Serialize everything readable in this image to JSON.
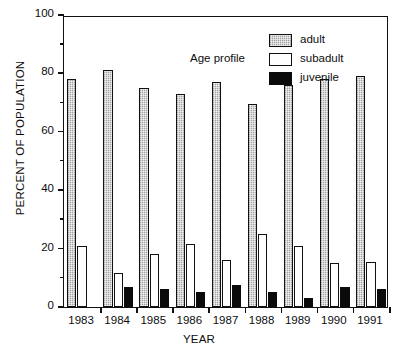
{
  "chart_data": {
    "type": "bar",
    "title": "",
    "subtitle": "",
    "xlabel": "YEAR",
    "ylabel": "PERCENT OF POPULATION",
    "categories": [
      "1983",
      "1984",
      "1985",
      "1986",
      "1987",
      "1988",
      "1989",
      "1990",
      "1991"
    ],
    "series": [
      {
        "name": "adult",
        "values": [
          78,
          81,
          75,
          73,
          77,
          69.5,
          76,
          78,
          79
        ]
      },
      {
        "name": "subadult",
        "values": [
          21,
          11.5,
          18,
          21.5,
          16,
          25,
          21,
          15,
          15.5
        ]
      },
      {
        "name": "juvenile",
        "values": [
          0,
          7,
          6,
          5,
          7.5,
          5,
          3,
          7,
          6
        ]
      }
    ],
    "ylim": [
      0,
      100
    ],
    "yticks": [
      0,
      20,
      40,
      60,
      80,
      100
    ],
    "ytick_labels": [
      "0",
      "20",
      "40",
      "60",
      "80",
      "100"
    ],
    "yminor_ticks": [
      10,
      30,
      50,
      70,
      90
    ],
    "grid": false,
    "legend_position": "top-center",
    "legend_title": "Age profile",
    "colors": {
      "adult": "#c9c9c9",
      "subadult": "#ffffff",
      "juvenile": "#0b0b0b",
      "axis": "#111111"
    }
  },
  "legend": {
    "title": "Age profile",
    "entries": [
      {
        "label": "adult",
        "swatch": "adult"
      },
      {
        "label": "subadult",
        "swatch": "subadult"
      },
      {
        "label": "juvenile",
        "swatch": "juvenile"
      }
    ]
  }
}
